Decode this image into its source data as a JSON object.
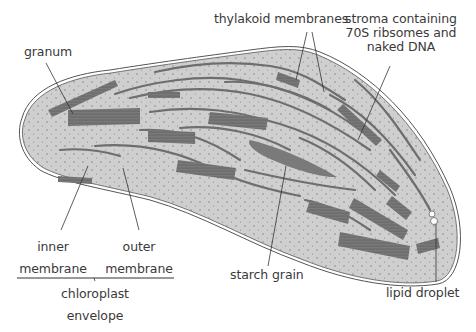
{
  "diagram": {
    "colors": {
      "background": "#ffffff",
      "stroma_fill": "#cfcfcf",
      "membrane_stroke": "#555555",
      "thylakoid": "#6e6e6e",
      "starch": "#7a7a7a",
      "dots": "#777777",
      "label_text": "#3a3a3a",
      "leader_line": "#333333"
    },
    "labels": {
      "granum": "granum",
      "thylakoid_membranes": "thylakoid membranes",
      "stroma_line1": "stroma containing",
      "stroma_line2": "70S ribsomes and",
      "stroma_line3": "naked DNA",
      "inner_line1": "inner",
      "inner_line2": "membrane",
      "outer_line1": "outer",
      "outer_line2": "membrane",
      "envelope_line1": "chloroplast",
      "envelope_line2": "envelope",
      "starch_grain": "starch grain",
      "lipid_droplet": "lipid droplet"
    }
  }
}
